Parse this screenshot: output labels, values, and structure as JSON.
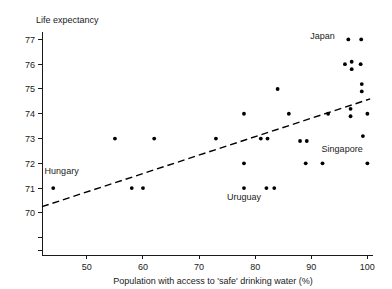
{
  "chart_data": {
    "type": "scatter",
    "title": "",
    "xlabel": "Population with access to 'safe' drinking water (%)",
    "ylabel": "Life expectancy",
    "xlim": [
      42,
      101
    ],
    "ylim": [
      68.3,
      77.3
    ],
    "xticks": [
      50,
      60,
      70,
      80,
      90,
      100
    ],
    "xtick_labels": [
      "50",
      "60",
      "70",
      "80",
      "90",
      "100"
    ],
    "yticks": [
      77,
      76,
      75,
      74,
      73,
      72,
      71,
      70,
      69,
      68.5
    ],
    "ytick_labels": [
      "77",
      "76",
      "75",
      "74",
      "73",
      "72",
      "71",
      "70",
      "",
      ""
    ],
    "grid": false,
    "legend": "none",
    "points": [
      {
        "x": 44.0,
        "y": 71.0
      },
      {
        "x": 55.0,
        "y": 73.0
      },
      {
        "x": 58.0,
        "y": 71.0
      },
      {
        "x": 60.0,
        "y": 71.0
      },
      {
        "x": 62.0,
        "y": 73.0
      },
      {
        "x": 73.0,
        "y": 73.0
      },
      {
        "x": 78.0,
        "y": 74.0
      },
      {
        "x": 78.0,
        "y": 72.0
      },
      {
        "x": 78.0,
        "y": 71.0
      },
      {
        "x": 81.0,
        "y": 73.0
      },
      {
        "x": 82.2,
        "y": 73.0
      },
      {
        "x": 82.0,
        "y": 71.0
      },
      {
        "x": 83.4,
        "y": 71.0
      },
      {
        "x": 84.0,
        "y": 75.0
      },
      {
        "x": 86.0,
        "y": 74.0
      },
      {
        "x": 88.0,
        "y": 72.9
      },
      {
        "x": 89.2,
        "y": 72.9
      },
      {
        "x": 89.0,
        "y": 72.0
      },
      {
        "x": 92.0,
        "y": 72.0
      },
      {
        "x": 93.0,
        "y": 74.0
      },
      {
        "x": 96.0,
        "y": 76.0
      },
      {
        "x": 96.6,
        "y": 77.0
      },
      {
        "x": 97.2,
        "y": 76.1
      },
      {
        "x": 97.2,
        "y": 75.8
      },
      {
        "x": 97.0,
        "y": 74.2
      },
      {
        "x": 97.0,
        "y": 73.9
      },
      {
        "x": 98.9,
        "y": 77.0
      },
      {
        "x": 98.8,
        "y": 76.0
      },
      {
        "x": 99.0,
        "y": 75.2
      },
      {
        "x": 99.0,
        "y": 74.9
      },
      {
        "x": 99.2,
        "y": 73.1
      },
      {
        "x": 100.0,
        "y": 74.0
      },
      {
        "x": 100.0,
        "y": 72.0
      }
    ],
    "trend_line": {
      "style": "dashed",
      "x0": 42.0,
      "y0": 70.25,
      "x1": 100.5,
      "y1": 74.6
    },
    "annotations": [
      {
        "label": "Hungary",
        "x": 45.5,
        "y": 71.55,
        "anchor": "middle"
      },
      {
        "label": "Uruguay",
        "x": 78.0,
        "y": 70.5,
        "anchor": "middle"
      },
      {
        "label": "Singapore",
        "x": 95.5,
        "y": 72.45,
        "anchor": "middle"
      },
      {
        "label": "Japan",
        "x": 94.2,
        "y": 77.0,
        "anchor": "end"
      }
    ]
  },
  "axis": {
    "y_title": "Life expectancy",
    "x_title": "Population with access to 'safe' drinking water (%)"
  },
  "colors": {
    "point": "#000000",
    "axis": "#1a1a1a",
    "trend": "#000000",
    "background": "#ffffff"
  }
}
